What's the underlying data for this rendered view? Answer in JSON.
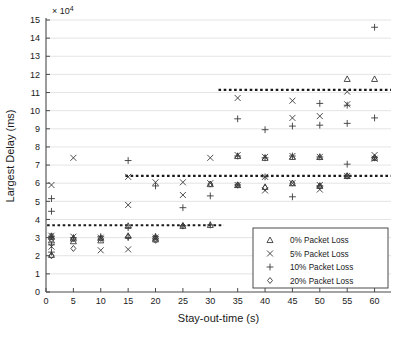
{
  "figure": {
    "title": "",
    "background": "#ffffff"
  },
  "axes": {
    "xlabel": "Stay-out-time (s)",
    "ylabel": "Largest Delay (ms)",
    "y_exponent_label": "× 10",
    "y_exponent_power": "4",
    "xticks": [
      0,
      5,
      10,
      15,
      20,
      25,
      30,
      35,
      40,
      45,
      50,
      55,
      60
    ],
    "yticks": [
      0,
      1,
      2,
      3,
      4,
      5,
      6,
      7,
      8,
      9,
      10,
      11,
      12,
      13,
      14,
      15
    ],
    "xlim": [
      0,
      63
    ],
    "ylim": [
      0,
      15
    ],
    "grid": "horizontal"
  },
  "legend": {
    "position": "lower-right",
    "items": [
      {
        "label": "0% Packet Loss",
        "marker": "triangle"
      },
      {
        "label": "5% Packet Loss",
        "marker": "cross-x"
      },
      {
        "label": "10% Packet Loss",
        "marker": "plus"
      },
      {
        "label": "20% Packet Loss",
        "marker": "diamond"
      }
    ]
  },
  "chart_data": {
    "type": "scatter",
    "title": "",
    "xlabel": "Stay-out-time (s)",
    "ylabel": "Largest Delay (ms)",
    "y_scale_multiplier": 10000,
    "xlim": [
      0,
      63
    ],
    "ylim": [
      0,
      15
    ],
    "xticks": [
      0,
      5,
      10,
      15,
      20,
      25,
      30,
      35,
      40,
      45,
      50,
      55,
      60
    ],
    "yticks": [
      0,
      1,
      2,
      3,
      4,
      5,
      6,
      7,
      8,
      9,
      10,
      11,
      12,
      13,
      14,
      15
    ],
    "grid": true,
    "legend_position": "lower-right",
    "series": [
      {
        "name": "0% Packet Loss",
        "marker": "triangle",
        "points": [
          [
            1,
            3.05
          ],
          [
            1,
            2.85
          ],
          [
            1,
            2.05
          ],
          [
            5,
            2.95
          ],
          [
            5,
            2.8
          ],
          [
            10,
            3.0
          ],
          [
            10,
            2.85
          ],
          [
            15,
            3.1
          ],
          [
            15,
            3.65
          ],
          [
            20,
            3.05
          ],
          [
            20,
            2.9
          ],
          [
            25,
            3.65
          ],
          [
            30,
            3.7
          ],
          [
            30,
            5.95
          ],
          [
            35,
            5.9
          ],
          [
            35,
            7.5
          ],
          [
            40,
            5.8
          ],
          [
            40,
            7.4
          ],
          [
            45,
            6.0
          ],
          [
            45,
            7.45
          ],
          [
            50,
            5.85
          ],
          [
            50,
            7.45
          ],
          [
            55,
            11.75
          ],
          [
            55,
            6.4
          ],
          [
            60,
            11.75
          ],
          [
            60,
            7.4
          ]
        ]
      },
      {
        "name": "5% Packet Loss",
        "marker": "cross-x",
        "points": [
          [
            1,
            5.9
          ],
          [
            1,
            3.1
          ],
          [
            1,
            2.5
          ],
          [
            5,
            7.4
          ],
          [
            5,
            3.05
          ],
          [
            10,
            3.0
          ],
          [
            10,
            2.3
          ],
          [
            15,
            6.35
          ],
          [
            15,
            4.8
          ],
          [
            15,
            2.35
          ],
          [
            20,
            6.05
          ],
          [
            20,
            3.0
          ],
          [
            25,
            6.05
          ],
          [
            25,
            5.35
          ],
          [
            30,
            7.4
          ],
          [
            30,
            6.0
          ],
          [
            35,
            10.7
          ],
          [
            35,
            7.55
          ],
          [
            35,
            5.9
          ],
          [
            40,
            7.45
          ],
          [
            40,
            6.35
          ],
          [
            40,
            5.6
          ],
          [
            45,
            10.55
          ],
          [
            45,
            9.6
          ],
          [
            45,
            7.5
          ],
          [
            45,
            6.0
          ],
          [
            50,
            9.7
          ],
          [
            50,
            7.45
          ],
          [
            50,
            5.9
          ],
          [
            50,
            5.65
          ],
          [
            55,
            11.05
          ],
          [
            55,
            10.35
          ],
          [
            55,
            6.4
          ],
          [
            60,
            7.55
          ],
          [
            60,
            7.35
          ]
        ]
      },
      {
        "name": "10% Packet Loss",
        "marker": "plus",
        "points": [
          [
            1,
            5.15
          ],
          [
            1,
            4.45
          ],
          [
            1,
            3.05
          ],
          [
            1,
            2.6
          ],
          [
            1,
            2.2
          ],
          [
            5,
            3.0
          ],
          [
            10,
            3.05
          ],
          [
            15,
            7.25
          ],
          [
            15,
            3.55
          ],
          [
            15,
            3.0
          ],
          [
            20,
            5.85
          ],
          [
            20,
            3.05
          ],
          [
            25,
            4.65
          ],
          [
            25,
            3.65
          ],
          [
            30,
            5.3
          ],
          [
            30,
            3.7
          ],
          [
            35,
            9.55
          ],
          [
            35,
            7.5
          ],
          [
            35,
            5.9
          ],
          [
            40,
            8.95
          ],
          [
            40,
            7.4
          ],
          [
            40,
            6.35
          ],
          [
            45,
            9.15
          ],
          [
            45,
            7.5
          ],
          [
            45,
            5.25
          ],
          [
            50,
            10.4
          ],
          [
            50,
            9.2
          ],
          [
            50,
            7.45
          ],
          [
            50,
            5.85
          ],
          [
            55,
            10.3
          ],
          [
            55,
            9.3
          ],
          [
            55,
            7.05
          ],
          [
            55,
            6.4
          ],
          [
            60,
            14.6
          ],
          [
            60,
            9.6
          ],
          [
            60,
            7.4
          ]
        ]
      },
      {
        "name": "20% Packet Loss",
        "marker": "diamond",
        "points": [
          [
            1,
            3.1
          ],
          [
            1,
            2.9
          ],
          [
            1,
            2.0
          ],
          [
            5,
            2.95
          ],
          [
            5,
            2.4
          ],
          [
            10,
            2.95
          ],
          [
            15,
            3.05
          ],
          [
            20,
            2.95
          ],
          [
            20,
            2.85
          ],
          [
            25,
            3.65
          ],
          [
            30,
            5.95
          ],
          [
            35,
            5.9
          ],
          [
            40,
            5.75
          ],
          [
            45,
            6.0
          ],
          [
            50,
            5.85
          ],
          [
            55,
            6.4
          ],
          [
            60,
            7.4
          ]
        ]
      }
    ],
    "threshold_lines": [
      {
        "name": "upper-threshold",
        "y": 11.15,
        "x_start": 31.5,
        "x_end": 63.0
      },
      {
        "name": "middle-threshold",
        "y": 6.4,
        "x_start": 14.5,
        "x_end": 63.0
      },
      {
        "name": "lower-threshold",
        "y": 3.68,
        "x_start": 0.2,
        "x_end": 32.5
      }
    ]
  }
}
